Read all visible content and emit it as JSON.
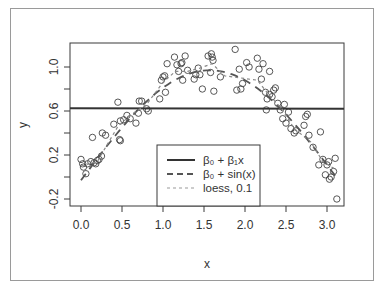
{
  "chart_data": {
    "type": "scatter",
    "title": "",
    "xlabel": "x",
    "ylabel": "y",
    "xlim": [
      -0.13,
      3.24
    ],
    "ylim": [
      -0.27,
      1.2
    ],
    "x_ticks": [
      0.0,
      0.5,
      1.0,
      1.5,
      2.0,
      2.5,
      3.0
    ],
    "x_tick_labels": [
      "0.0",
      "0.5",
      "1.0",
      "1.5",
      "2.0",
      "2.5",
      "3.0"
    ],
    "y_ticks": [
      -0.2,
      0.0,
      0.2,
      0.4,
      0.6,
      0.8,
      1.0
    ],
    "y_tick_labels": [
      "-0.2",
      "",
      "0.2",
      "",
      "0.6",
      "",
      "1.0"
    ],
    "grid": false,
    "legend_position": "bottom-center",
    "legend": [
      {
        "label": "β₀ + β₁x",
        "style": "solid"
      },
      {
        "label": "β₀ + sin(x)",
        "style": "dashed"
      },
      {
        "label": "loess, 0.1",
        "style": "dotted"
      }
    ],
    "series": [
      {
        "name": "observations",
        "kind": "points",
        "marker": "open-circle",
        "points": [
          [
            0.0,
            0.16
          ],
          [
            0.02,
            0.12
          ],
          [
            0.03,
            0.09
          ],
          [
            0.06,
            0.03
          ],
          [
            0.08,
            0.12
          ],
          [
            0.12,
            0.14
          ],
          [
            0.14,
            0.36
          ],
          [
            0.16,
            0.13
          ],
          [
            0.18,
            0.12
          ],
          [
            0.2,
            0.15
          ],
          [
            0.22,
            0.16
          ],
          [
            0.25,
            0.19
          ],
          [
            0.26,
            0.4
          ],
          [
            0.3,
            0.38
          ],
          [
            0.4,
            0.48
          ],
          [
            0.45,
            0.68
          ],
          [
            0.47,
            0.34
          ],
          [
            0.48,
            0.33
          ],
          [
            0.48,
            0.51
          ],
          [
            0.52,
            0.52
          ],
          [
            0.56,
            0.56
          ],
          [
            0.6,
            0.53
          ],
          [
            0.67,
            0.49
          ],
          [
            0.7,
            0.58
          ],
          [
            0.71,
            0.69
          ],
          [
            0.74,
            0.69
          ],
          [
            0.8,
            0.62
          ],
          [
            0.82,
            0.6
          ],
          [
            0.96,
            0.71
          ],
          [
            0.98,
            0.88
          ],
          [
            1.0,
            0.91
          ],
          [
            1.02,
            0.92
          ],
          [
            1.03,
            0.77
          ],
          [
            1.05,
            1.03
          ],
          [
            1.14,
            1.09
          ],
          [
            1.17,
            1.02
          ],
          [
            1.19,
            0.96
          ],
          [
            1.22,
            1.03
          ],
          [
            1.23,
            1.04
          ],
          [
            1.24,
            0.88
          ],
          [
            1.27,
            1.1
          ],
          [
            1.3,
            0.97
          ],
          [
            1.38,
            0.89
          ],
          [
            1.4,
            0.93
          ],
          [
            1.43,
            0.99
          ],
          [
            1.45,
            0.93
          ],
          [
            1.48,
            0.8
          ],
          [
            1.55,
            1.1
          ],
          [
            1.58,
            0.95
          ],
          [
            1.59,
            1.12
          ],
          [
            1.6,
            1.09
          ],
          [
            1.61,
            1.06
          ],
          [
            1.62,
            0.78
          ],
          [
            1.7,
            0.91
          ],
          [
            1.88,
            1.16
          ],
          [
            1.9,
            0.79
          ],
          [
            1.93,
            0.98
          ],
          [
            1.95,
            0.8
          ],
          [
            1.97,
            0.85
          ],
          [
            2.02,
            1.04
          ],
          [
            2.05,
            1.0
          ],
          [
            2.15,
            1.08
          ],
          [
            2.17,
            0.98
          ],
          [
            2.2,
            0.89
          ],
          [
            2.22,
            1.03
          ],
          [
            2.25,
            0.77
          ],
          [
            2.26,
            0.61
          ],
          [
            2.27,
            0.71
          ],
          [
            2.3,
            0.96
          ],
          [
            2.3,
            0.75
          ],
          [
            2.33,
            0.73
          ],
          [
            2.35,
            0.79
          ],
          [
            2.37,
            0.81
          ],
          [
            2.4,
            0.67
          ],
          [
            2.43,
            0.61
          ],
          [
            2.46,
            0.53
          ],
          [
            2.48,
            0.66
          ],
          [
            2.5,
            0.49
          ],
          [
            2.53,
            0.59
          ],
          [
            2.56,
            0.44
          ],
          [
            2.6,
            0.4
          ],
          [
            2.62,
            0.42
          ],
          [
            2.72,
            0.47
          ],
          [
            2.74,
            0.55
          ],
          [
            2.76,
            0.57
          ],
          [
            2.78,
            0.38
          ],
          [
            2.83,
            0.27
          ],
          [
            2.9,
            0.11
          ],
          [
            2.92,
            0.41
          ],
          [
            2.95,
            0.16
          ],
          [
            2.98,
            0.02
          ],
          [
            3.0,
            0.11
          ],
          [
            3.02,
            0.14
          ],
          [
            3.03,
            -0.02
          ],
          [
            3.05,
            0.0
          ],
          [
            3.08,
            0.05
          ],
          [
            3.1,
            0.17
          ],
          [
            3.12,
            -0.2
          ]
        ]
      },
      {
        "name": "β₀ + β₁x",
        "kind": "line",
        "style": "solid",
        "points": [
          [
            -0.13,
            0.625
          ],
          [
            3.24,
            0.62
          ]
        ]
      },
      {
        "name": "β₀ + sin(x)",
        "kind": "line",
        "style": "dashed",
        "intercept": -0.03,
        "x_range": [
          0.0,
          3.14
        ]
      },
      {
        "name": "loess, 0.1",
        "kind": "line",
        "style": "dotted",
        "points": [
          [
            0.0,
            0.1
          ],
          [
            0.2,
            0.14
          ],
          [
            0.3,
            0.27
          ],
          [
            0.45,
            0.46
          ],
          [
            0.6,
            0.56
          ],
          [
            0.8,
            0.66
          ],
          [
            1.0,
            0.86
          ],
          [
            1.15,
            0.96
          ],
          [
            1.3,
            0.96
          ],
          [
            1.45,
            0.99
          ],
          [
            1.6,
            1.03
          ],
          [
            1.75,
            0.92
          ],
          [
            1.95,
            0.9
          ],
          [
            2.15,
            0.88
          ],
          [
            2.3,
            0.74
          ],
          [
            2.45,
            0.62
          ],
          [
            2.6,
            0.44
          ],
          [
            2.8,
            0.32
          ],
          [
            2.95,
            0.14
          ],
          [
            3.1,
            0.07
          ]
        ]
      }
    ]
  },
  "caption": {
    "text": ""
  }
}
